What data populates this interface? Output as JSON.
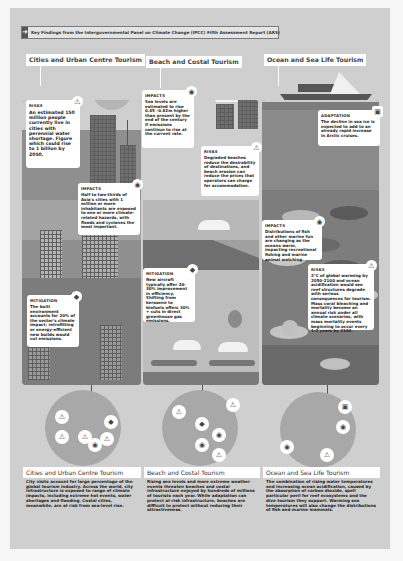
{
  "header": {
    "icon": "arrow-right-icon",
    "title": "Key Findings from the Intergovernmental Panel on Climate Change (IPCC) Fifth Assessment Report (AR5)"
  },
  "columns": [
    {
      "id": "city",
      "title": "Cities and Urban Centre Tourism",
      "cards": [
        {
          "type": "RISKS",
          "icon": "warning-icon",
          "text": "An estimated 150 million people currently live in cities with perennial water shortage. Figure which could rise to 1 billion by 2050."
        },
        {
          "type": "IMPACTS",
          "icon": "target-icon",
          "text": "Half to two-thirds of Asia's cities with 1 million or more inhabitants are exposed to one or more climate-related hazards, with floods and cyclones the most important."
        },
        {
          "type": "MITIGATION",
          "icon": "diamond-icon",
          "text": "The built environment accounts for 20% of the sector's climate impact; retrofitting or energy-efficient new builds would cut emissions."
        }
      ]
    },
    {
      "id": "beach",
      "title": "Beach and Costal Tourism",
      "cards": [
        {
          "type": "IMPACTS",
          "icon": "target-icon",
          "text": "Sea levels are estimated to rise 0.45 –0.82m higher than present by the end of the century if emissions continue to rise at the current rate."
        },
        {
          "type": "RISKS",
          "icon": "warning-icon",
          "text": "Degraded beaches reduce the desirability of destinations, and beach erosion can reduce the prices that operators can charge for accommodation."
        },
        {
          "type": "MITIGATION",
          "icon": "diamond-icon",
          "text": "New aircraft typically offer 20-30% improvement in efficiency. Shifting from kerosene to biofuels offers 30% + cuts in direct greenhouse gas emissions."
        }
      ]
    },
    {
      "id": "ocean",
      "title": "Ocean and Sea Life Tourism",
      "cards": [
        {
          "type": "ADAPTATION",
          "icon": "square-icon",
          "text": "The decline in sea ice is expected to add to an already rapid increase in Arctic cruises."
        },
        {
          "type": "IMPACTS",
          "icon": "target-icon",
          "text": "Distributions of fish and other marine fun are changing as the oceans warm, impacting recreational fishing and marine animal watching."
        },
        {
          "type": "RISKS",
          "icon": "warning-icon",
          "text": "2°C of global warming by 2050-2100 and ocean acidification would see reef structures degrade with serious consequences for tourism. Mass coral bleaching and mortality become an annual risk under all climate scenarios, with mass mortality events beginning to occur every 1-2 years by 2100."
        }
      ]
    }
  ],
  "summaries": [
    {
      "title": "Cities and Urban Centre Tourism",
      "text": "City visits account for large percentage of the global tourism industry. Across the world, city infrastructure is exposed to range of climate impacts, including extreme hot events, water shortages and flooding. Costal cities, meanwhile, are at risk from sea-level rise."
    },
    {
      "title": "Beach and Costal Tourism",
      "text": "Rising sea levels and more extreme weather events threaten beaches and costal infrastructure enjoyed by hundreds of millions of tourists each year. While adaptation can protect at-risk infrastructure, beaches are difficult to protect without reducing their attractiveness."
    },
    {
      "title": "Ocean and Sea Life Tourism",
      "text": "The combination of rising water temperatures and increasing ocean acidification, caused by the absorption of carbon dioxide, spell particular peril for reef ecosystems and the dive tourism they support. Warming sea temperatures will also change the distributions of fish and marine mammals."
    }
  ],
  "glyphs": {
    "warning": "⚠",
    "target": "◉",
    "diamond": "◆",
    "square": "▣",
    "arrow": "➜"
  },
  "colors": {
    "page": "#f6f6f6",
    "sheet": "#cfcfcf",
    "panel_city": "#8f8f8f",
    "panel_beach": "#a0a0a0",
    "panel_ocean": "#7d7d7d",
    "card": "#ffffff"
  }
}
